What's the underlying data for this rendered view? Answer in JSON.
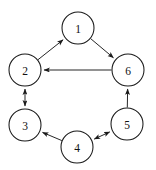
{
  "diagram": {
    "kind": "directed-graph",
    "canvas": {
      "width": 156,
      "height": 170,
      "background": "#ffffff"
    },
    "style": {
      "node_fill": "#ffffff",
      "node_stroke": "#1a1a1a",
      "edge_stroke": "#1a1a1a",
      "label_color": "#111111",
      "node_radius": 16
    },
    "nodes": [
      {
        "id": "1",
        "label": "1",
        "cx": 78,
        "cy": 28,
        "r": 16
      },
      {
        "id": "2",
        "label": "2",
        "cx": 25,
        "cy": 70,
        "r": 16
      },
      {
        "id": "3",
        "label": "3",
        "cx": 25,
        "cy": 125,
        "r": 16
      },
      {
        "id": "4",
        "label": "4",
        "cx": 77,
        "cy": 147,
        "r": 16
      },
      {
        "id": "5",
        "label": "5",
        "cx": 127,
        "cy": 124,
        "r": 16
      },
      {
        "id": "6",
        "label": "6",
        "cx": 128,
        "cy": 70,
        "r": 16
      }
    ],
    "edges": [
      {
        "id": "e-2-1",
        "from": "2",
        "to": "1",
        "direction": "forward",
        "label": "2 to 1"
      },
      {
        "id": "e-1-6",
        "from": "1",
        "to": "6",
        "direction": "forward",
        "label": "1 to 6"
      },
      {
        "id": "e-6-2",
        "from": "6",
        "to": "2",
        "direction": "forward",
        "label": "6 to 2"
      },
      {
        "id": "e-2-3",
        "from": "2",
        "to": "3",
        "direction": "bidirectional",
        "label": "2 and 3"
      },
      {
        "id": "e-4-3",
        "from": "4",
        "to": "3",
        "direction": "forward",
        "label": "4 to 3"
      },
      {
        "id": "e-4-5",
        "from": "4",
        "to": "5",
        "direction": "bidirectional",
        "label": "4 and 5"
      },
      {
        "id": "e-5-6",
        "from": "5",
        "to": "6",
        "direction": "forward",
        "label": "5 to 6"
      }
    ]
  }
}
